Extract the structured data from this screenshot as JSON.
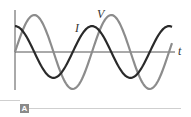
{
  "figure": {
    "panel_label": "A",
    "labels": {
      "voltage": "V",
      "current": "I",
      "time_axis": "t"
    },
    "colors": {
      "voltage": "#8c8c8c",
      "current": "#2a2a2a",
      "axis": "#555555",
      "panel_tag": "#8a8a8a"
    }
  },
  "chart_data": {
    "type": "line",
    "title": "",
    "xlabel": "t",
    "ylabel": "",
    "grid": false,
    "legend": "inline labels",
    "series": [
      {
        "name": "V",
        "description": "sinusoidal voltage, larger amplitude, starts at zero rising",
        "amplitude": 1.0,
        "phase_deg": 0,
        "cycles_shown": 2.05
      },
      {
        "name": "I",
        "description": "sinusoidal current, smaller amplitude, leads V by 90 degrees (starts near maximum)",
        "amplitude": 0.7,
        "phase_deg": 90,
        "cycles_shown": 2.05
      }
    ]
  }
}
